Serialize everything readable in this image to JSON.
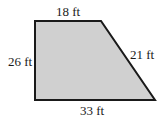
{
  "diagram": {
    "shape": "right trapezoid",
    "fill_color": "#d0d0d0",
    "stroke_color": "#1a1a1a",
    "vertices": [
      [
        35,
        21
      ],
      [
        101,
        21
      ],
      [
        155,
        100
      ],
      [
        35,
        100
      ]
    ],
    "labels": {
      "top": "18 ft",
      "right": "21 ft",
      "left": "26 ft",
      "bottom": "33 ft"
    }
  }
}
